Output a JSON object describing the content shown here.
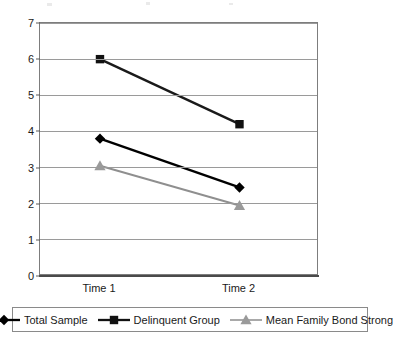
{
  "chart_data": {
    "type": "line",
    "title": "",
    "subtitle": "",
    "xlabel": "",
    "ylabel": "",
    "categories": [
      "Time 1",
      "Time 2"
    ],
    "x": [
      0,
      1
    ],
    "ylim": [
      0,
      7
    ],
    "ytick_labels": [
      "0",
      "1",
      "2",
      "3",
      "4",
      "5",
      "6",
      "7"
    ],
    "ytick_values": [
      0,
      1,
      2,
      3,
      4,
      5,
      6,
      7
    ],
    "grid": true,
    "grid_axis": "y",
    "legend_position": "bottom",
    "series": [
      {
        "name": "Total Sample",
        "values": [
          3.8,
          2.45
        ],
        "marker": "diamond",
        "color": "#000000",
        "marker_color": "#000000"
      },
      {
        "name": "Delinquent Group",
        "values": [
          6.0,
          4.2
        ],
        "marker": "square",
        "color": "#1a1a1a",
        "marker_color": "#111111"
      },
      {
        "name": "Mean Family Bond Strong",
        "values": [
          3.05,
          1.95
        ],
        "marker": "triangle",
        "color": "#8f8f8f",
        "marker_color": "#9a9a9a"
      }
    ]
  },
  "axes": {
    "y_labels": [
      "7",
      "6",
      "5",
      "4",
      "3",
      "2",
      "1",
      "0"
    ],
    "x_labels": [
      "Time 1",
      "Time 2"
    ]
  },
  "legend": {
    "entries": [
      {
        "label": "Total Sample",
        "marker": "diamond-marker",
        "color": "#000000"
      },
      {
        "label": "Delinquent Group",
        "marker": "square-marker",
        "color": "#111111"
      },
      {
        "label": "Mean Family Bond Strong",
        "marker": "triangle-marker",
        "color": "#9a9a9a"
      }
    ]
  }
}
